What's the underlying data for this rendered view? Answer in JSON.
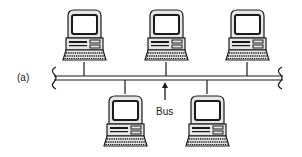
{
  "figure": {
    "panel_label": "(a)",
    "bus_label": "Bus",
    "topology": "bus",
    "colors": {
      "stroke": "#1a1a1a",
      "screen": "#ffffff",
      "body": "#e6e6e6",
      "background": "#ffffff"
    },
    "computers": [
      {
        "id": "pc-top-1",
        "position": "top"
      },
      {
        "id": "pc-top-2",
        "position": "top"
      },
      {
        "id": "pc-top-3",
        "position": "top"
      },
      {
        "id": "pc-bottom-1",
        "position": "bottom"
      },
      {
        "id": "pc-bottom-2",
        "position": "bottom"
      }
    ]
  }
}
